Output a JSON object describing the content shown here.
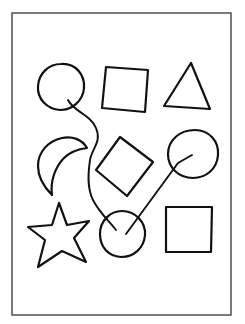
{
  "worksheet": {
    "frame": {
      "x": 12,
      "y": 13,
      "width": 219,
      "height": 302
    },
    "colors": {
      "background": "#ffffff",
      "ink": "#111111",
      "frame": "#444444"
    },
    "shapes": [
      {
        "id": "circle-top-left",
        "type": "circle",
        "row": 1,
        "col": 1,
        "cx": 61,
        "cy": 87,
        "r": 23
      },
      {
        "id": "square-top-middle",
        "type": "square",
        "row": 1,
        "col": 2
      },
      {
        "id": "triangle-top-right",
        "type": "triangle",
        "row": 1,
        "col": 3
      },
      {
        "id": "crescent-middle-left",
        "type": "crescent",
        "row": 2,
        "col": 1
      },
      {
        "id": "diamond-center",
        "type": "diamond",
        "row": 2,
        "col": 2
      },
      {
        "id": "circle-middle-right",
        "type": "circle",
        "row": 2,
        "col": 3,
        "cx": 193,
        "cy": 155,
        "r": 26
      },
      {
        "id": "star-bottom-left",
        "type": "star",
        "row": 3,
        "col": 1
      },
      {
        "id": "circle-bottom-middle",
        "type": "circle",
        "row": 3,
        "col": 2,
        "cx": 122,
        "cy": 234,
        "r": 23
      },
      {
        "id": "square-bottom-right",
        "type": "square",
        "row": 3,
        "col": 3
      }
    ],
    "connections": [
      {
        "from": "circle-top-left",
        "to": "circle-bottom-middle",
        "style": "curvy"
      },
      {
        "from": "circle-middle-right",
        "to": "circle-bottom-middle",
        "style": "straight"
      }
    ]
  }
}
